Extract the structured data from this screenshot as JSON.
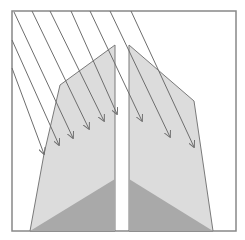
{
  "diagram": {
    "width": 245,
    "height": 240,
    "colors": {
      "background": "#ffffff",
      "frame": "#888888",
      "shape_fill": "#dcdcdc",
      "shape_stroke": "#7a7a7a",
      "base_fill": "#a9a9a9",
      "arrow": "#6e6e6e"
    },
    "frame": {
      "x": 12,
      "y": 11,
      "w": 224,
      "h": 220
    },
    "left_shape": {
      "outline": "44,154 60,85 115,45 115,231 30,231",
      "base": "30,231 115,179 115,231"
    },
    "right_shape": {
      "outline": "129,45 194,101 213,231 129,231",
      "base": "129,179 213,231 129,231"
    },
    "arrows": [
      {
        "x1": 12,
        "y1": 68,
        "x2": 44,
        "y2": 154
      },
      {
        "x1": 12,
        "y1": 40,
        "x2": 59,
        "y2": 145
      },
      {
        "x1": 14,
        "y1": 12,
        "x2": 73,
        "y2": 138
      },
      {
        "x1": 32,
        "y1": 11,
        "x2": 89,
        "y2": 129
      },
      {
        "x1": 50,
        "y1": 11,
        "x2": 104,
        "y2": 121
      },
      {
        "x1": 71,
        "y1": 11,
        "x2": 117,
        "y2": 114
      },
      {
        "x1": 90,
        "y1": 11,
        "x2": 142,
        "y2": 121
      },
      {
        "x1": 110,
        "y1": 11,
        "x2": 170,
        "y2": 137
      },
      {
        "x1": 131,
        "y1": 11,
        "x2": 194,
        "y2": 147
      }
    ]
  }
}
